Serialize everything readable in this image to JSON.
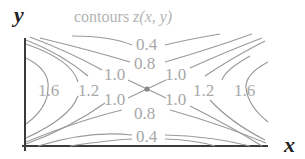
{
  "diagram": {
    "title_prefix": "contours ",
    "title_func": "z(x, y)",
    "x_axis_label": "x",
    "y_axis_label": "y",
    "saddle_point": {
      "x": 147,
      "y": 89,
      "color": "#8a8a8a"
    },
    "colors": {
      "axis": "#3a3a3a",
      "contour": "#9a9a9a",
      "label": "#a8a8a8",
      "title": "#b4b4b4"
    },
    "level_labels": [
      {
        "text": "0.4",
        "position": "top"
      },
      {
        "text": "0.8",
        "position": "top"
      },
      {
        "text": "1.0",
        "position": "upper-left"
      },
      {
        "text": "1.0",
        "position": "upper-right"
      },
      {
        "text": "1.6",
        "position": "left"
      },
      {
        "text": "1.2",
        "position": "left"
      },
      {
        "text": "1.0",
        "position": "lower-left"
      },
      {
        "text": "1.0",
        "position": "lower-right"
      },
      {
        "text": "1.2",
        "position": "right"
      },
      {
        "text": "1.6",
        "position": "right"
      },
      {
        "text": "0.8",
        "position": "bottom"
      },
      {
        "text": "0.4",
        "position": "bottom"
      }
    ]
  }
}
